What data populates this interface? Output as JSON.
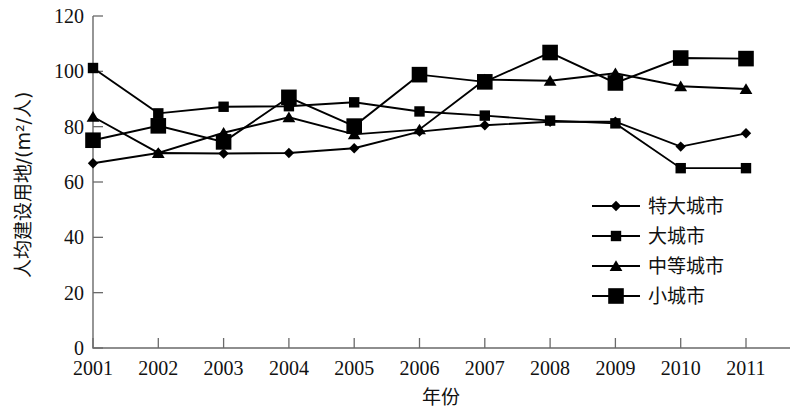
{
  "chart_data": {
    "type": "line",
    "title": "",
    "xlabel": "年份",
    "ylabel": "人均建设用地/(m²/人)",
    "categories": [
      "2001",
      "2002",
      "2003",
      "2004",
      "2005",
      "2006",
      "2007",
      "2008",
      "2009",
      "2010",
      "2011"
    ],
    "x": [
      2001,
      2002,
      2003,
      2004,
      2005,
      2006,
      2007,
      2008,
      2009,
      2010,
      2011
    ],
    "ylim": [
      0,
      120
    ],
    "yticks": [
      "0",
      "20",
      "40",
      "60",
      "80",
      "100",
      "120"
    ],
    "ytick_values": [
      0,
      20,
      40,
      60,
      80,
      100,
      120
    ],
    "grid": false,
    "legend_position": "center-right",
    "series": [
      {
        "name": "特大城市",
        "marker": "diamond",
        "values": [
          66.8,
          70.5,
          70.3,
          70.5,
          72.2,
          78.2,
          80.5,
          81.8,
          81.8,
          72.8,
          77.6
        ]
      },
      {
        "name": "大城市",
        "marker": "square-small",
        "values": [
          101.2,
          84.8,
          87.2,
          87.4,
          88.8,
          85.5,
          84.0,
          82.2,
          81.2,
          65.0,
          65.0
        ]
      },
      {
        "name": "中等城市",
        "marker": "triangle",
        "values": [
          83.6,
          70.5,
          77.8,
          83.4,
          77.2,
          79.0,
          97.0,
          96.6,
          99.3,
          94.6,
          93.6
        ]
      },
      {
        "name": "小城市",
        "marker": "square-large",
        "values": [
          75.1,
          80.3,
          74.5,
          90.6,
          80.2,
          98.8,
          96.2,
          106.8,
          95.8,
          104.8,
          104.6
        ]
      }
    ]
  },
  "axes": {
    "y_axis_title": "人均建设用地/(m²/人)",
    "x_axis_title": "年份"
  },
  "legend": {
    "items": [
      {
        "label": "特大城市",
        "marker": "diamond"
      },
      {
        "label": "大城市",
        "marker": "square-small"
      },
      {
        "label": "中等城市",
        "marker": "triangle"
      },
      {
        "label": "小城市",
        "marker": "square-large"
      }
    ]
  }
}
